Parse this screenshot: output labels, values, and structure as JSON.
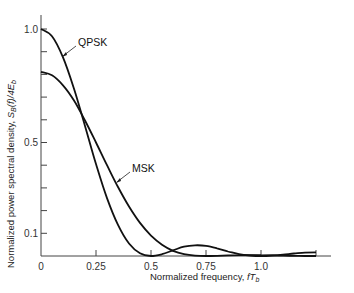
{
  "chart_data": {
    "type": "line",
    "title": "",
    "xlabel": "Normalized frequency, fT_b",
    "ylabel": "Normalized power spectral density, S_B(f)/4E_b",
    "xlim": [
      0,
      1.25
    ],
    "ylim": [
      0,
      1.0
    ],
    "x_ticks": [
      0,
      0.25,
      0.5,
      0.75,
      1.0,
      1.25
    ],
    "x_tick_labels": [
      "0",
      "0.25",
      "0.5",
      "0.75",
      "1.0",
      ""
    ],
    "y_ticks": [
      0.1,
      0.2,
      0.3,
      0.4,
      0.5,
      0.6,
      0.7,
      0.8,
      0.9,
      1.0
    ],
    "y_tick_labels": {
      "0.1": "0.1",
      "0.5": "0.5",
      "1.0": "1.0"
    },
    "grid": false,
    "legend": "inline annotations with arrows",
    "x": [
      0,
      0.05,
      0.1,
      0.15,
      0.2,
      0.25,
      0.3,
      0.35,
      0.4,
      0.45,
      0.5,
      0.55,
      0.6,
      0.65,
      0.7,
      0.75,
      0.8,
      0.85,
      0.9,
      0.95,
      1.0,
      1.05,
      1.1,
      1.15,
      1.2,
      1.25
    ],
    "series": [
      {
        "name": "QPSK",
        "values": [
          1.0,
          0.968,
          0.875,
          0.737,
          0.573,
          0.405,
          0.255,
          0.137,
          0.055,
          0.012,
          0.0,
          0.008,
          0.025,
          0.041,
          0.047,
          0.045,
          0.034,
          0.02,
          0.008,
          0.002,
          0.0,
          0.002,
          0.006,
          0.011,
          0.015,
          0.016
        ]
      },
      {
        "name": "MSK",
        "values": [
          0.811,
          0.796,
          0.752,
          0.685,
          0.597,
          0.5,
          0.4,
          0.304,
          0.218,
          0.146,
          0.09,
          0.05,
          0.023,
          0.0085,
          0.0017,
          0.0,
          0.0009,
          0.0025,
          0.0037,
          0.0041,
          0.0036,
          0.0027,
          0.0016,
          0.0007,
          0.0002,
          0.0
        ]
      }
    ],
    "annotations": [
      {
        "text": "QPSK",
        "points_to": "QPSK"
      },
      {
        "text": "MSK",
        "points_to": "MSK"
      }
    ]
  },
  "labels": {
    "xlabel_main": "Normalized frequency, ",
    "xlabel_var": "fT",
    "xlabel_sub": "b",
    "ylabel_main": "Normalized power spectral density, ",
    "ylabel_var": "S",
    "ylabel_sub": "B",
    "ylabel_rest": "(f)/4E",
    "ylabel_sub2": "b",
    "qpsk": "QPSK",
    "msk": "MSK"
  }
}
